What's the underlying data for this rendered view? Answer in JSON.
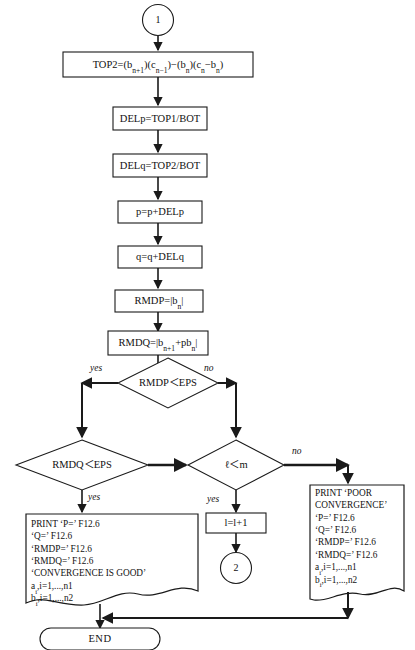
{
  "diagram": {
    "nodes": {
      "connector_in": {
        "label": "1"
      },
      "top2": {
        "text": "TOP2=(b<sub>n+1</sub>)(c<sub>n−1</sub>)−(b<sub>n</sub>)(c<sub>n</sub>−b<sub>n</sub>)"
      },
      "delp": {
        "text": "DELp=TOP1/BOT"
      },
      "delq": {
        "text": "DELq=TOP2/BOT"
      },
      "p_update": {
        "text": "p=p+DELp"
      },
      "q_update": {
        "text": "q=q+DELq"
      },
      "rmdp": {
        "text": "RMDP=|b<sub>n</sub>|"
      },
      "rmdq": {
        "text": "RMDQ=|b<sub>n+1</sub>+pb<sub>n</sub>|"
      },
      "decision_rmdp": {
        "text": "RMDP＜EPS",
        "yes": "yes",
        "no": "no"
      },
      "decision_rmdq": {
        "text": "RMDQ＜EPS",
        "yes": "yes"
      },
      "decision_lm": {
        "text": "ℓ＜m",
        "yes": "yes",
        "no": "no"
      },
      "l_increment": {
        "text": "l=l+1"
      },
      "connector_out": {
        "label": "2"
      },
      "print_good": {
        "lines": [
          "PRINT ‘P=’ F12.6",
          "‘Q=’ F12.6",
          "‘RMDP=’ F12.6",
          "‘RMDQ=’ F12.6",
          "‘CONVERGENCE IS GOOD’",
          "a<sub>i</sub>,i=1,...,n1",
          "b<sub>i</sub>,i=1,...,n2"
        ]
      },
      "print_poor": {
        "lines": [
          "PRINT ‘POOR",
          "CONVERGENCE’",
          "‘P=’ F12.6",
          "‘Q=’ F12.6",
          "‘RMDP=’ F12.6",
          "‘RMDQ=’ F12.6",
          "a<sub>i</sub>,i=1,...,n1",
          "b<sub>i</sub>,i=1,...,n2"
        ]
      },
      "end": {
        "text": "END"
      }
    },
    "colors": {
      "stroke": "#1a1a1a",
      "fill": "#ffffff",
      "text": "#111111"
    }
  }
}
